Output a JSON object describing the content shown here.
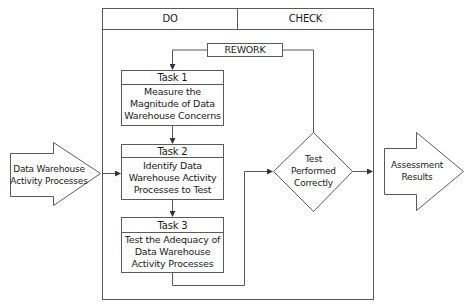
{
  "header": {
    "do_label": "DO",
    "check_label": "CHECK"
  },
  "rework": {
    "label": "REWORK"
  },
  "input_arrow": {
    "line1": "Data Warehouse",
    "line2": "Activity Processes"
  },
  "output_arrow": {
    "line1": "Assessment",
    "line2": "Results"
  },
  "tasks": [
    {
      "title": "Task 1",
      "lines": [
        "Measure the",
        "Magnitude of Data",
        "Warehouse Concerns"
      ]
    },
    {
      "title": "Task 2",
      "lines": [
        "Identify Data",
        "Warehouse Activity",
        "Processes to Test"
      ]
    },
    {
      "title": "Task 3",
      "lines": [
        "Test the Adequacy of",
        "Data Warehouse",
        "Activity Processes"
      ]
    }
  ],
  "decision": {
    "lines": [
      "Test",
      "Performed",
      "Correctly"
    ]
  },
  "colors": {
    "stroke": "#5a5a5a",
    "text": "#1a1a1a",
    "background": "#ffffff"
  }
}
